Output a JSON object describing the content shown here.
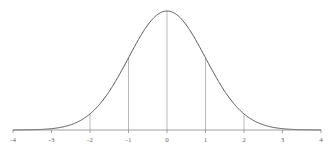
{
  "chart_data": {
    "type": "line",
    "title": "",
    "xlabel": "",
    "ylabel": "",
    "xlim": [
      -4,
      4
    ],
    "ylim": [
      0,
      0.4
    ],
    "grid": false,
    "legend": null,
    "x_ticks": [
      -4,
      -3,
      -2,
      -1,
      0,
      1,
      2,
      3,
      4
    ],
    "x_tick_labels": [
      "-4",
      "-3",
      "-2",
      "-1",
      "0",
      "1",
      "2",
      "3",
      "4"
    ],
    "vertical_lines_at": [
      -2,
      -1,
      0,
      1,
      2
    ],
    "series": [
      {
        "name": "normal pdf",
        "mean": 0,
        "std": 1,
        "x": [
          -4,
          -3.5,
          -3,
          -2.5,
          -2,
          -1.5,
          -1,
          -0.5,
          0,
          0.5,
          1,
          1.5,
          2,
          2.5,
          3,
          3.5,
          4
        ],
        "y": [
          0.0001,
          0.0009,
          0.0044,
          0.0175,
          0.054,
          0.1295,
          0.242,
          0.3521,
          0.3989,
          0.3521,
          0.242,
          0.1295,
          0.054,
          0.0175,
          0.0044,
          0.0009,
          0.0001
        ]
      }
    ],
    "colors": {
      "curve": "#555555",
      "axis": "#888888",
      "vlines": "#aaaaaa"
    }
  }
}
